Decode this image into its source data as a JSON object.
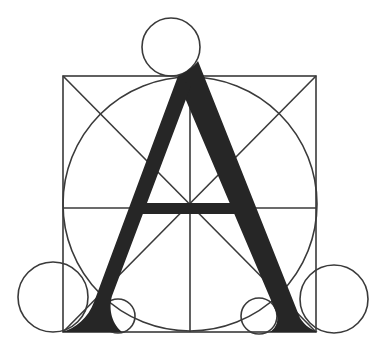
{
  "figure": {
    "title": "Geometric construction of the capital letter A",
    "letter": "A",
    "colors": {
      "background": "#ffffff",
      "line": "#3a3a3a",
      "glyph": "#262626"
    },
    "construction": {
      "square": {
        "x": 63,
        "y": 76,
        "width": 253,
        "height": 256
      },
      "inscribed_circle": {
        "cx": 190,
        "cy": 204,
        "r": 127
      },
      "top_circle": {
        "cx": 171,
        "cy": 47,
        "r": 29
      },
      "left_outer_circle": {
        "cx": 53,
        "cy": 297,
        "r": 35
      },
      "left_inner_circle": {
        "cx": 118,
        "cy": 316,
        "r": 17
      },
      "right_inner_circle": {
        "cx": 259,
        "cy": 316,
        "r": 18
      },
      "right_outer_circle": {
        "cx": 334,
        "cy": 299,
        "r": 34
      },
      "vertical_axis_x": 190,
      "horizontal_axis_y": 208
    }
  }
}
